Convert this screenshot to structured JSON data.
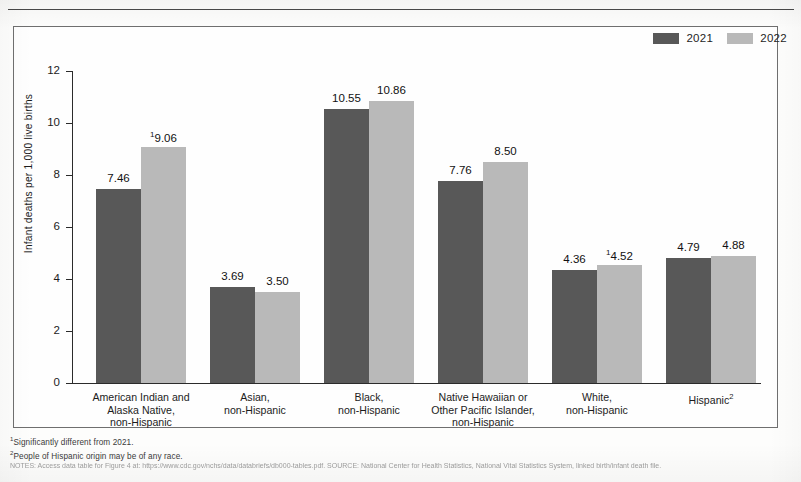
{
  "chart_data": {
    "type": "bar",
    "title": "",
    "xlabel": "",
    "ylabel": "Infant deaths per 1,000 live births",
    "ylim": [
      0,
      12
    ],
    "ytick_labels": [
      "12",
      "10",
      "8",
      "6",
      "4",
      "2",
      "0"
    ],
    "ytick_values": [
      12,
      10,
      8,
      6,
      4,
      2,
      0
    ],
    "grid": false,
    "legend_position": "top-right",
    "categories": [
      "American Indian and Alaska Native, non-Hispanic",
      "Asian, non-Hispanic",
      "Black, non-Hispanic",
      "Native Hawaiian or Other Pacific Islander, non-Hispanic",
      "White, non-Hispanic",
      "Hispanic"
    ],
    "category_lines": [
      [
        "American Indian and",
        "Alaska Native,",
        "non-Hispanic"
      ],
      [
        "Asian,",
        "non-Hispanic"
      ],
      [
        "Black,",
        "non-Hispanic"
      ],
      [
        "Native Hawaiian or",
        "Other Pacific Islander,",
        "non-Hispanic"
      ],
      [
        "White,",
        "non-Hispanic"
      ],
      [
        "Hispanic"
      ]
    ],
    "category_footnote_markers": [
      "",
      "",
      "",
      "",
      "",
      "2"
    ],
    "series": [
      {
        "name": "2021",
        "color": "#585858",
        "values": [
          7.46,
          3.69,
          10.55,
          7.76,
          4.36,
          4.79
        ],
        "labels": [
          "7.46",
          "3.69",
          "10.55",
          "7.76",
          "4.36",
          "4.79"
        ],
        "footnote_markers": [
          "",
          "",
          "",
          "",
          "",
          ""
        ]
      },
      {
        "name": "2022",
        "color": "#b9b9b9",
        "values": [
          9.06,
          3.5,
          10.86,
          8.5,
          4.52,
          4.88
        ],
        "labels": [
          "9.06",
          "3.50",
          "10.86",
          "8.50",
          "4.52",
          "4.88"
        ],
        "footnote_markers": [
          "1",
          "",
          "",
          "",
          "1",
          ""
        ]
      }
    ]
  },
  "legend": {
    "items": [
      {
        "label": "2021",
        "color": "#585858"
      },
      {
        "label": "2022",
        "color": "#b9b9b9"
      }
    ]
  },
  "footnotes": {
    "note1_marker": "1",
    "note1_text": "Significantly different from 2021.",
    "note2_marker": "2",
    "note2_text": "People of Hispanic origin may be of any race.",
    "source_text": "NOTES: Access data table for Figure 4 at: https://www.cdc.gov/nchs/data/databriefs/db000-tables.pdf. SOURCE: National Center for Health Statistics, National Vital Statistics System, linked birth/infant death file."
  }
}
